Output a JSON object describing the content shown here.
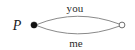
{
  "figure": {
    "background_color": "#ffffff",
    "width": 135,
    "height": 50,
    "point_label": "P",
    "nodes": [
      {
        "id": "source-node",
        "icon": "filled-dot-icon",
        "style": "filled",
        "fill_color": "#111111",
        "stroke_color": "#111111",
        "cx": 34,
        "cy": 25,
        "r": 3.1,
        "label": "P"
      },
      {
        "id": "target-node",
        "icon": "hollow-circle-icon",
        "style": "hollow",
        "fill_color": "#ffffff",
        "stroke_color": "#6f6f6f",
        "cx": 122,
        "cy": 25,
        "r": 2.9,
        "label": ""
      }
    ],
    "edges": [
      {
        "id": "edge-you",
        "label": "you",
        "position": "above",
        "stroke_color": "#8a8a8a",
        "stroke_width": 1
      },
      {
        "id": "edge-me",
        "label": "me",
        "position": "below",
        "stroke_color": "#8a8a8a",
        "stroke_width": 1
      }
    ]
  }
}
